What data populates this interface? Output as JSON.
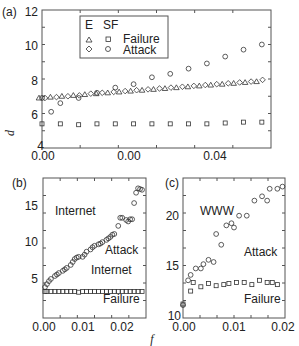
{
  "figure": {
    "xlabel": "f",
    "ylabel": "d"
  },
  "panels": {
    "a": {
      "label": "(a)",
      "yticks": [
        "12",
        "10",
        "8",
        "6",
        "4"
      ],
      "xticks": [
        "0.00",
        "0.00",
        "0.04"
      ],
      "legend": {
        "header_e": "E",
        "header_sf": "SF",
        "row1_label": "Failure",
        "row2_label": "Attack"
      }
    },
    "b": {
      "label": "(b)",
      "yticks": [
        "15",
        "10",
        "5"
      ],
      "xticks": [
        "0.00",
        "0.01",
        "0.02"
      ],
      "annotations": [
        "Internet",
        "Attack",
        "Internet",
        "Failure"
      ]
    },
    "c": {
      "label": "(c)",
      "yticks": [
        "20",
        "15",
        "10"
      ],
      "xticks": [
        "0.00",
        "0.01",
        "0.02"
      ],
      "annotations": [
        "WWW",
        "Attack",
        "Failure"
      ]
    }
  },
  "chart_data": [
    {
      "type": "scatter",
      "panel": "a",
      "title": "",
      "xlabel": "f",
      "ylabel": "d",
      "xlim": [
        0,
        0.05
      ],
      "ylim": [
        4,
        12
      ],
      "xtick_labels": [
        "0.00",
        "0.00",
        "0.04"
      ],
      "ytick_labels": [
        "4",
        "6",
        "8",
        "10",
        "12"
      ],
      "grid": false,
      "legend_position": "upper center",
      "legend": [
        "E Failure (triangle)",
        "E Attack (diamond)",
        "SF Failure (square)",
        "SF Attack (circle)"
      ],
      "series": [
        {
          "name": "E Failure",
          "marker": "triangle",
          "x": [
            0.0,
            0.0025,
            0.005,
            0.0075,
            0.01,
            0.0125,
            0.015,
            0.0175,
            0.02,
            0.0225,
            0.025,
            0.0275,
            0.03,
            0.0325,
            0.035,
            0.0375,
            0.04,
            0.0425,
            0.045,
            0.0475
          ],
          "y": [
            6.9,
            6.95,
            7.0,
            7.05,
            7.1,
            7.15,
            7.2,
            7.25,
            7.3,
            7.35,
            7.4,
            7.45,
            7.5,
            7.55,
            7.6,
            7.65,
            7.7,
            7.75,
            7.8,
            7.85
          ]
        },
        {
          "name": "E Attack",
          "marker": "diamond",
          "x": [
            0.0,
            0.0025,
            0.005,
            0.0075,
            0.01,
            0.0125,
            0.015,
            0.0175,
            0.02,
            0.0225,
            0.025,
            0.0275,
            0.03,
            0.0325,
            0.035,
            0.0375,
            0.04,
            0.0425,
            0.045,
            0.0475
          ],
          "y": [
            6.9,
            6.95,
            7.0,
            7.05,
            7.15,
            7.2,
            7.25,
            7.3,
            7.35,
            7.4,
            7.45,
            7.5,
            7.55,
            7.6,
            7.65,
            7.7,
            7.75,
            7.8,
            7.85,
            7.95
          ]
        },
        {
          "name": "SF Failure",
          "marker": "square",
          "x": [
            0.0,
            0.004,
            0.008,
            0.012,
            0.016,
            0.02,
            0.024,
            0.028,
            0.032,
            0.036,
            0.04,
            0.044,
            0.048
          ],
          "y": [
            5.4,
            5.4,
            5.35,
            5.4,
            5.4,
            5.4,
            5.4,
            5.4,
            5.4,
            5.4,
            5.45,
            5.5,
            5.5
          ]
        },
        {
          "name": "SF Attack",
          "marker": "circle",
          "x": [
            0.0,
            0.002,
            0.004,
            0.008,
            0.012,
            0.016,
            0.02,
            0.024,
            0.028,
            0.032,
            0.036,
            0.04,
            0.044,
            0.048
          ],
          "y": [
            6.9,
            6.1,
            6.6,
            6.9,
            7.2,
            7.5,
            7.7,
            8.1,
            8.3,
            8.6,
            8.9,
            9.3,
            9.7,
            10.0
          ]
        }
      ]
    },
    {
      "type": "scatter",
      "panel": "b",
      "title": "Internet",
      "xlabel": "f",
      "ylabel": "d",
      "xlim": [
        0,
        0.026
      ],
      "ylim": [
        0,
        19
      ],
      "xtick_labels": [
        "0.00",
        "0.01",
        "0.02"
      ],
      "ytick_labels": [
        "5",
        "10",
        "15"
      ],
      "grid": false,
      "annotations": [
        "Internet",
        "Attack",
        "Internet",
        "Failure"
      ],
      "series": [
        {
          "name": "Internet Attack",
          "marker": "circle",
          "x": [
            0.0005,
            0.001,
            0.0015,
            0.002,
            0.003,
            0.0035,
            0.004,
            0.005,
            0.0055,
            0.006,
            0.007,
            0.0075,
            0.008,
            0.0085,
            0.009,
            0.01,
            0.0105,
            0.011,
            0.012,
            0.0125,
            0.013,
            0.014,
            0.0145,
            0.015,
            0.016,
            0.0165,
            0.017,
            0.0175,
            0.018,
            0.019,
            0.0195,
            0.02,
            0.021,
            0.0215,
            0.022,
            0.0225,
            0.023,
            0.0235,
            0.024,
            0.0245,
            0.025
          ],
          "y": [
            4.2,
            4.6,
            5.0,
            5.3,
            5.7,
            5.9,
            6.1,
            6.4,
            6.6,
            6.8,
            7.2,
            7.6,
            8.0,
            8.2,
            8.3,
            8.3,
            8.6,
            9.0,
            9.3,
            9.6,
            9.8,
            10.0,
            10.1,
            10.3,
            10.6,
            10.8,
            11.0,
            11.3,
            11.4,
            12.5,
            13.6,
            13.6,
            13.3,
            13.1,
            13.4,
            13.4,
            15.6,
            17.0,
            17.6,
            17.5,
            17.4
          ]
        },
        {
          "name": "Internet Failure",
          "marker": "square",
          "x": [
            0.0005,
            0.001,
            0.002,
            0.003,
            0.004,
            0.005,
            0.006,
            0.007,
            0.008,
            0.009,
            0.01,
            0.011,
            0.012,
            0.013,
            0.014,
            0.015,
            0.016,
            0.017,
            0.018,
            0.019,
            0.02,
            0.021,
            0.022,
            0.023,
            0.024,
            0.025
          ],
          "y": [
            3.6,
            3.6,
            3.6,
            3.6,
            3.6,
            3.6,
            3.6,
            3.6,
            3.6,
            3.5,
            3.6,
            3.6,
            3.6,
            3.6,
            3.6,
            3.6,
            3.6,
            3.6,
            3.6,
            3.6,
            3.6,
            3.6,
            3.6,
            3.6,
            3.6,
            3.6
          ]
        }
      ]
    },
    {
      "type": "scatter",
      "panel": "c",
      "title": "WWW",
      "xlabel": "f",
      "ylabel": "d",
      "xlim": [
        0,
        0.02
      ],
      "ylim": [
        10,
        23
      ],
      "xtick_labels": [
        "0.00",
        "0.01",
        "0.02"
      ],
      "ytick_labels": [
        "10",
        "15",
        "20"
      ],
      "grid": false,
      "annotations": [
        "WWW",
        "Attack",
        "Failure"
      ],
      "series": [
        {
          "name": "WWW Attack",
          "marker": "circle",
          "x": [
            0.0,
            0.001,
            0.0015,
            0.0025,
            0.0035,
            0.004,
            0.005,
            0.006,
            0.0065,
            0.0075,
            0.0085,
            0.0095,
            0.01,
            0.011,
            0.0125,
            0.014,
            0.0155,
            0.0165,
            0.017,
            0.0185,
            0.0195
          ],
          "y": [
            11.2,
            13.5,
            14.0,
            14.6,
            14.6,
            15.0,
            15.4,
            15.2,
            17.8,
            16.8,
            18.6,
            18.8,
            18.4,
            19.5,
            19.5,
            20.9,
            21.3,
            20.9,
            22.0,
            22.0,
            22.2
          ]
        },
        {
          "name": "WWW Failure",
          "marker": "square",
          "x": [
            0.0,
            0.0015,
            0.002,
            0.0035,
            0.005,
            0.0065,
            0.008,
            0.009,
            0.0105,
            0.012,
            0.0135,
            0.015,
            0.0165,
            0.0175,
            0.0185
          ],
          "y": [
            11.3,
            12.5,
            13.3,
            12.9,
            13.2,
            13.0,
            13.1,
            13.2,
            13.3,
            13.3,
            13.1,
            13.5,
            13.3,
            13.3,
            13.1
          ]
        }
      ]
    }
  ]
}
